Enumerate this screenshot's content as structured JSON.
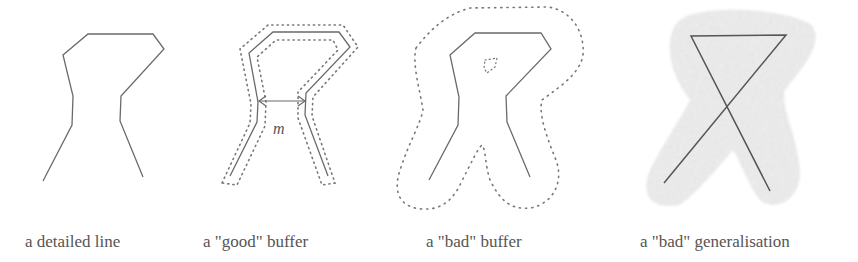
{
  "figure": {
    "panels": [
      {
        "id": "detailed-line",
        "label": "a detailed line"
      },
      {
        "id": "good-buffer",
        "label": "a \"good\" buffer",
        "measure_label": "m"
      },
      {
        "id": "bad-buffer",
        "label": "a \"bad\" buffer"
      },
      {
        "id": "bad-generalisation",
        "label": "a \"bad\" generalisation"
      }
    ]
  },
  "colors": {
    "line": "#6a6a6a",
    "dots": "#777777",
    "text": "#555555",
    "blur": "#d8d8d8"
  }
}
